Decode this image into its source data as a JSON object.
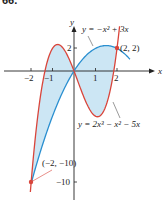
{
  "problem_number": "66.",
  "chart_data": {
    "type": "line",
    "title": "",
    "xlabel": "x",
    "ylabel": "y",
    "xlim": [
      -2.4,
      2.9
    ],
    "ylim": [
      -11,
      4
    ],
    "x_ticks": [
      -2,
      -1,
      1,
      2
    ],
    "y_ticks": [
      2,
      -10
    ],
    "series": [
      {
        "name": "y = -x^2 + 3x",
        "color": "#2a8fd0",
        "label": "y = −x² + 3x"
      },
      {
        "name": "y = 2x^3 - x^2 - 5x",
        "color": "#d9453b",
        "label": "y = 2x³ − x² − 5x"
      }
    ],
    "shaded_region": {
      "between": [
        "y = -x^2 + 3x",
        "y = 2x^3 - x^2 - 5x"
      ],
      "x_range": [
        -2,
        2
      ],
      "color": "#cce6f4"
    },
    "points": [
      {
        "x": 2,
        "y": 2,
        "label": "(2, 2)"
      },
      {
        "x": -2,
        "y": -10,
        "label": "(−2, −10)"
      }
    ]
  },
  "labels": {
    "x_axis": "x",
    "y_axis": "y",
    "tick_neg2": "−2",
    "tick_neg1": "−1",
    "tick_1": "1",
    "tick_2": "2",
    "tick_y2": "2",
    "tick_yneg10": "−10",
    "curve1": "y = −x² + 3x",
    "curve2": "y = 2x³ − x² − 5x",
    "point1": "(2, 2)",
    "point2": "(−2, −10)"
  }
}
